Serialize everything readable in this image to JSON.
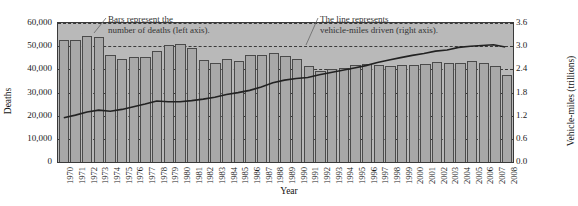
{
  "chart_data": {
    "type": "bar",
    "title": "",
    "xlabel": "Year",
    "ylabel": "Deaths",
    "y2label": "Vehicle-miles (trillions)",
    "ylim": [
      0,
      60000
    ],
    "y2lim": [
      0.0,
      3.6
    ],
    "grid": true,
    "legend_position": "annotations",
    "categories": [
      "1970",
      "1971",
      "1972",
      "1973",
      "1974",
      "1975",
      "1976",
      "1977",
      "1978",
      "1979",
      "1980",
      "1981",
      "1982",
      "1983",
      "1984",
      "1985",
      "1986",
      "1987",
      "1988",
      "1989",
      "1990",
      "1991",
      "1992",
      "1993",
      "1994",
      "1995",
      "1996",
      "1997",
      "1998",
      "1999",
      "2000",
      "2001",
      "2002",
      "2003",
      "2004",
      "2005",
      "2006",
      "2007",
      "2008"
    ],
    "y_ticks": [
      "0",
      "10,000",
      "20,000",
      "30,000",
      "40,000",
      "50,000",
      "60,000"
    ],
    "y2_ticks": [
      "0.0",
      "0.6",
      "1.2",
      "1.8",
      "2.4",
      "3.0",
      "3.6"
    ],
    "series": [
      {
        "name": "Deaths",
        "axis": "left",
        "type": "bar",
        "values": [
          52600,
          52500,
          54600,
          54100,
          46400,
          44500,
          45500,
          45500,
          48000,
          50300,
          51100,
          49300,
          43900,
          42600,
          44300,
          43800,
          46100,
          46400,
          47100,
          45600,
          44600,
          41500,
          39300,
          40200,
          40700,
          41800,
          42100,
          42000,
          41500,
          41700,
          41900,
          42200,
          43000,
          42900,
          42800,
          43500,
          42700,
          41300,
          37400
        ]
      },
      {
        "name": "Vehicle-miles driven",
        "axis": "right",
        "type": "line",
        "values": [
          1.11,
          1.18,
          1.26,
          1.31,
          1.28,
          1.33,
          1.4,
          1.47,
          1.55,
          1.53,
          1.53,
          1.56,
          1.6,
          1.65,
          1.72,
          1.77,
          1.83,
          1.92,
          2.03,
          2.1,
          2.14,
          2.17,
          2.24,
          2.3,
          2.36,
          2.42,
          2.48,
          2.56,
          2.63,
          2.69,
          2.75,
          2.8,
          2.86,
          2.89,
          2.96,
          2.99,
          3.01,
          3.03,
          2.97
        ]
      }
    ],
    "annotations": [
      {
        "id": "bars-callout",
        "line1": "Bars represent the",
        "line2": "number of deaths (left axis)."
      },
      {
        "id": "line-callout",
        "line1": "The line represents",
        "line2": "vehicle-miles driven (right axis)."
      }
    ]
  },
  "axes": {
    "left_title": "Deaths",
    "right_title": "Vehicle-miles (trillions)",
    "x_title": "Year"
  },
  "annotations": {
    "bars": {
      "line1": "Bars represent the",
      "line2": "number of deaths (left axis)."
    },
    "line": {
      "line1": "The line represents",
      "line2": "vehicle-miles driven (right axis)."
    }
  },
  "colors": {
    "plot_background": "#b9b9b9",
    "bar_fill": "#a8a8a8",
    "bar_stroke": "#4a4a4a",
    "line_stroke": "#222222",
    "grid": "#3a3a3a"
  }
}
